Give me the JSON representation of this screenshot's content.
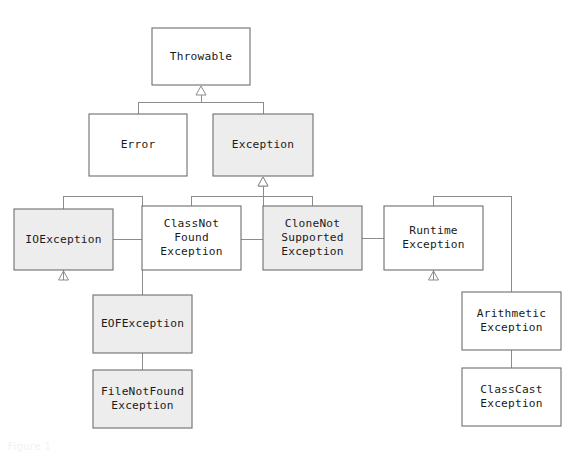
{
  "diagram": {
    "type": "class-hierarchy",
    "notation": "UML generalization (hollow triangle arrowhead points to superclass)",
    "colors": {
      "box_stroke": "#6e6e6e",
      "box_fill_white": "#ffffff",
      "box_fill_gray": "#ededed",
      "connector": "#8c8c8c",
      "text": "#1a1a1a",
      "background": "#ffffff"
    },
    "legend": {
      "gray_meaning": "checked / highlighted class",
      "white_meaning": "unchecked / standard class"
    },
    "ghost_text": {
      "top": "",
      "bottom": "Figure 1"
    },
    "nodes": [
      {
        "id": "throwable",
        "label": "Throwable",
        "lines": [
          "Throwable"
        ],
        "fill": "white",
        "x": 152,
        "y": 28,
        "w": 98,
        "h": 57,
        "level": 0
      },
      {
        "id": "error",
        "label": "Error",
        "lines": [
          "Error"
        ],
        "fill": "white",
        "x": 89,
        "y": 114,
        "w": 98,
        "h": 62,
        "level": 1
      },
      {
        "id": "exception",
        "label": "Exception",
        "lines": [
          "Exception"
        ],
        "fill": "gray",
        "x": 213,
        "y": 114,
        "w": 100,
        "h": 62,
        "level": 1
      },
      {
        "id": "ioexception",
        "label": "IOException",
        "lines": [
          "IOException"
        ],
        "fill": "gray",
        "x": 14,
        "y": 209,
        "w": 99,
        "h": 61,
        "level": 2
      },
      {
        "id": "classnotfound",
        "label": "ClassNotFoundException",
        "lines": [
          "ClassNot",
          "Found",
          "Exception"
        ],
        "fill": "white",
        "x": 142,
        "y": 206,
        "w": 99,
        "h": 64,
        "level": 2
      },
      {
        "id": "clonenotsupported",
        "label": "CloneNotSupportedException",
        "lines": [
          "CloneNot",
          "Supported",
          "Exception"
        ],
        "fill": "gray",
        "x": 263,
        "y": 206,
        "w": 99,
        "h": 64,
        "level": 2
      },
      {
        "id": "runtimeexception",
        "label": "RuntimeException",
        "lines": [
          "Runtime",
          "Exception"
        ],
        "fill": "white",
        "x": 384,
        "y": 206,
        "w": 99,
        "h": 64,
        "level": 2
      },
      {
        "id": "eofexception",
        "label": "EOFException",
        "lines": [
          "EOFException"
        ],
        "fill": "gray",
        "x": 93,
        "y": 295,
        "w": 99,
        "h": 58,
        "level": 3
      },
      {
        "id": "filenotfound",
        "label": "FileNotFoundException",
        "lines": [
          "FileNotFound",
          "Exception"
        ],
        "fill": "gray",
        "x": 93,
        "y": 370,
        "w": 99,
        "h": 58,
        "level": 3
      },
      {
        "id": "arithmetic",
        "label": "ArithmeticException",
        "lines": [
          "Arithmetic",
          "Exception"
        ],
        "fill": "white",
        "x": 462,
        "y": 292,
        "w": 99,
        "h": 58,
        "level": 3
      },
      {
        "id": "classcast",
        "label": "ClassCastException",
        "lines": [
          "ClassCast",
          "Exception"
        ],
        "fill": "white",
        "x": 462,
        "y": 368,
        "w": 99,
        "h": 58,
        "level": 3
      }
    ],
    "edges": [
      {
        "from": "error",
        "to": "throwable",
        "kind": "generalization"
      },
      {
        "from": "exception",
        "to": "throwable",
        "kind": "generalization"
      },
      {
        "from": "ioexception",
        "to": "exception",
        "kind": "generalization"
      },
      {
        "from": "classnotfound",
        "to": "exception",
        "kind": "generalization"
      },
      {
        "from": "clonenotsupported",
        "to": "exception",
        "kind": "generalization"
      },
      {
        "from": "runtimeexception",
        "to": "exception",
        "kind": "generalization"
      },
      {
        "from": "eofexception",
        "to": "ioexception",
        "kind": "generalization"
      },
      {
        "from": "filenotfound",
        "to": "ioexception",
        "kind": "generalization"
      },
      {
        "from": "arithmetic",
        "to": "runtimeexception",
        "kind": "generalization"
      },
      {
        "from": "classcast",
        "to": "runtimeexception",
        "kind": "generalization"
      }
    ]
  }
}
